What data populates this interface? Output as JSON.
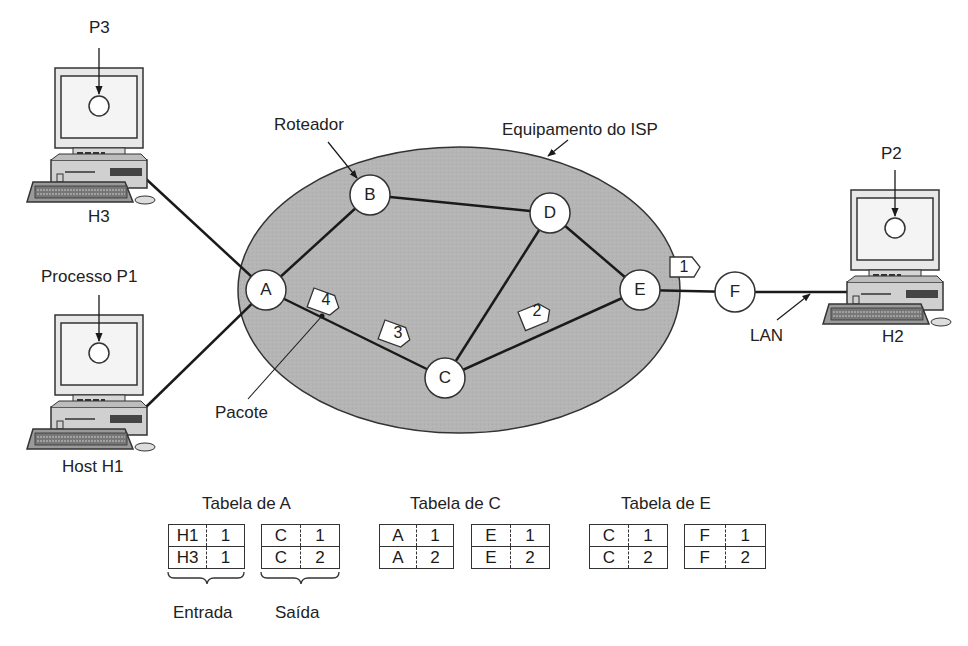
{
  "diagram": {
    "type": "network-routing",
    "cloud_label": "Equipamento do ISP",
    "router_label": "Roteador",
    "packet_label": "Pacote",
    "lan_label": "LAN",
    "colors": {
      "cloud_fill": "#b3b3b3",
      "line": "#1a1a1a",
      "node_fill": "#ffffff"
    },
    "routers": [
      {
        "id": "A",
        "label": "A"
      },
      {
        "id": "B",
        "label": "B"
      },
      {
        "id": "C",
        "label": "C"
      },
      {
        "id": "D",
        "label": "D"
      },
      {
        "id": "E",
        "label": "E"
      },
      {
        "id": "F",
        "label": "F"
      }
    ],
    "links": [
      [
        "H3",
        "A"
      ],
      [
        "H1",
        "A"
      ],
      [
        "A",
        "B"
      ],
      [
        "B",
        "D"
      ],
      [
        "A",
        "C"
      ],
      [
        "C",
        "D"
      ],
      [
        "D",
        "E"
      ],
      [
        "C",
        "E"
      ],
      [
        "E",
        "F"
      ],
      [
        "F",
        "H2"
      ]
    ],
    "packets": [
      {
        "id": "1",
        "label": "1"
      },
      {
        "id": "2",
        "label": "2"
      },
      {
        "id": "3",
        "label": "3"
      },
      {
        "id": "4",
        "label": "4"
      }
    ],
    "hosts": {
      "h3": {
        "name": "H3",
        "process": "P3"
      },
      "h1": {
        "name": "Host H1",
        "process": "Processo P1"
      },
      "h2": {
        "name": "H2",
        "process": "P2"
      }
    }
  },
  "tables": {
    "a": {
      "title": "Tabela de A",
      "entrada": [
        [
          "H1",
          "1"
        ],
        [
          "H3",
          "1"
        ]
      ],
      "saida": [
        [
          "C",
          "1"
        ],
        [
          "C",
          "2"
        ]
      ],
      "entrada_label": "Entrada",
      "saida_label": "Saída"
    },
    "c": {
      "title": "Tabela de C",
      "entrada": [
        [
          "A",
          "1"
        ],
        [
          "A",
          "2"
        ]
      ],
      "saida": [
        [
          "E",
          "1"
        ],
        [
          "E",
          "2"
        ]
      ]
    },
    "e": {
      "title": "Tabela de E",
      "entrada": [
        [
          "C",
          "1"
        ],
        [
          "C",
          "2"
        ]
      ],
      "saida": [
        [
          "F",
          "1"
        ],
        [
          "F",
          "2"
        ]
      ]
    }
  }
}
